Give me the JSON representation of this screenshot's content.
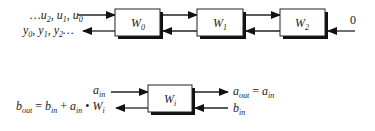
{
  "diagram": {
    "top_chain": {
      "input_label": "…u₂, u₁, u₀",
      "input_parts": {
        "prefix": "…u",
        "s2": "2",
        "c1": ", u",
        "s1": "1",
        "c2": ", u",
        "s0": "0"
      },
      "output_parts": {
        "y": "y",
        "s0": "0",
        "c1": ", y",
        "s1": "1",
        "c2": ", y",
        "s2": "2",
        "suffix": "…"
      },
      "boundary_value": "0",
      "blocks": [
        {
          "name": "W",
          "sub": "0"
        },
        {
          "name": "W",
          "sub": "1"
        },
        {
          "name": "W",
          "sub": "2"
        }
      ]
    },
    "cell": {
      "block": {
        "name": "W",
        "sub": "i"
      },
      "a_in": {
        "name": "a",
        "sub": "in"
      },
      "b_in": {
        "name": "b",
        "sub": "in"
      },
      "a_out_eq": {
        "lhs": "a",
        "lhs_sub": "out",
        "eq": " = ",
        "rhs": "a",
        "rhs_sub": "in"
      },
      "b_out_eq": {
        "lhs": "b",
        "lhs_sub": "out",
        "eq": " = ",
        "t1": "b",
        "t1_sub": "in",
        "plus": " + ",
        "t2": "a",
        "t2_sub": "in",
        "dot": " • ",
        "t3": "W",
        "t3_sub": "i"
      }
    }
  }
}
